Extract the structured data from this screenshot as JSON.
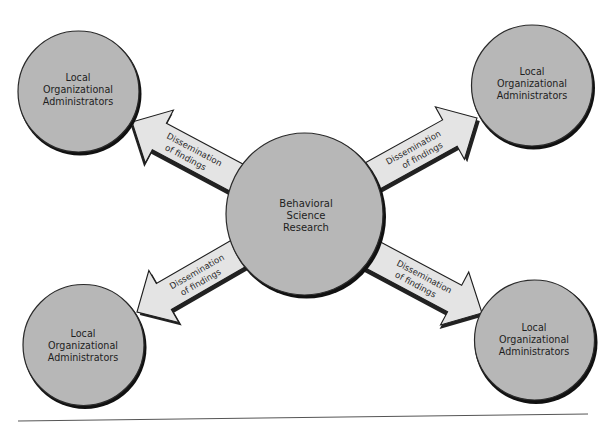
{
  "diagram": {
    "type": "hub-and-spoke",
    "center": {
      "lines": [
        "Behavioral",
        "Science",
        "Research"
      ]
    },
    "nodes": [
      {
        "position": "top-left",
        "lines": [
          "Local",
          "Organizational",
          "Administrators"
        ]
      },
      {
        "position": "top-right",
        "lines": [
          "Local",
          "Organizational",
          "Administrators"
        ]
      },
      {
        "position": "bottom-left",
        "lines": [
          "Local",
          "Organizational",
          "Administrators"
        ]
      },
      {
        "position": "bottom-right",
        "lines": [
          "Local",
          "Organizational",
          "Administrators"
        ]
      }
    ],
    "arrows": [
      {
        "from": "center",
        "to": "top-left",
        "lines": [
          "Dissemination",
          "of findings"
        ]
      },
      {
        "from": "center",
        "to": "top-right",
        "lines": [
          "Dissemination",
          "of findings"
        ]
      },
      {
        "from": "center",
        "to": "bottom-left",
        "lines": [
          "Dissemination",
          "of findings"
        ]
      },
      {
        "from": "center",
        "to": "bottom-right",
        "lines": [
          "Dissemination",
          "of findings"
        ]
      }
    ]
  },
  "colors": {
    "node_fill": "#b7b7b7",
    "arrow_fill": "#e4e4e4",
    "outline": "#1e1e1e",
    "background": "#ffffff"
  }
}
